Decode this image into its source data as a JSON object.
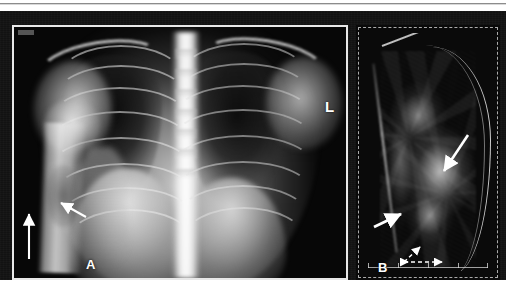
{
  "figure": {
    "type": "medical-imaging-figure",
    "panel_count": 2,
    "background_color": "#121212",
    "rule_color": "#8c8c8c"
  },
  "panel_a": {
    "label": "A",
    "modality": "chest-radiograph",
    "view": "frontal / anteroposterior chest X-ray",
    "side_marker": "L",
    "border_color": "#e8e8e8",
    "annotations": [
      {
        "name": "vertical-arrow",
        "style": "solid",
        "direction": "up",
        "color": "#ffffff"
      },
      {
        "name": "diagonal-arrow",
        "style": "solid",
        "direction": "up-left",
        "color": "#ffffff"
      }
    ]
  },
  "panel_b": {
    "label": "B",
    "modality": "ultrasound",
    "border_style": "dashed",
    "border_color": "#e1e1e1",
    "annotations": [
      {
        "name": "upper-arrow",
        "style": "solid",
        "direction": "down-left",
        "color": "#ffffff"
      },
      {
        "name": "lower-arrow",
        "style": "solid",
        "direction": "up-right",
        "color": "#ffffff"
      },
      {
        "name": "measure-arrow-horizontal",
        "style": "dashed",
        "direction": "bidirectional-right",
        "color": "#ffffff"
      },
      {
        "name": "measure-arrow-vertical",
        "style": "dashed",
        "direction": "up-right",
        "color": "#ffffff"
      }
    ],
    "scale_bar": {
      "name": "depth-ruler",
      "tick_count": 5
    }
  }
}
